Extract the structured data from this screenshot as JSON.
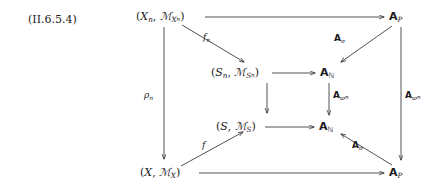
{
  "figure": {
    "tag": "(II.6.5.4)",
    "kind": "commutative-diagram"
  },
  "nodes": {
    "top_left": {
      "id": "X_n",
      "open": "(",
      "first": "X",
      "first_sub": "n",
      "comma": ", ",
      "sheaf": "ℳ",
      "sheaf_sub": "X",
      "sheaf_subsub": "n",
      "close": ")",
      "plain": "(X_n, ℳ_{X_n})"
    },
    "top_right": {
      "id": "A_P_top",
      "letter": "A",
      "sub": "P",
      "plain": "A_P"
    },
    "mid_upper_left": {
      "id": "S_n",
      "open": "(",
      "first": "S",
      "first_sub": "n",
      "comma": ", ",
      "sheaf": "ℳ",
      "sheaf_sub": "S",
      "sheaf_subsub": "n",
      "close": ")",
      "plain": "(S_n, ℳ_{S_n})"
    },
    "mid_upper_right": {
      "id": "A_N_upper",
      "letter": "A",
      "sub": "ℕ",
      "plain": "A_ℕ"
    },
    "mid_lower_left": {
      "id": "S",
      "open": "(",
      "first": "S",
      "first_sub": "",
      "comma": ", ",
      "sheaf": "ℳ",
      "sheaf_sub": "S",
      "sheaf_subsub": "",
      "close": ")",
      "plain": "(S, ℳ_S)"
    },
    "mid_lower_right": {
      "id": "A_N_lower",
      "letter": "A",
      "sub": "ℕ",
      "plain": "A_ℕ"
    },
    "bottom_left": {
      "id": "X",
      "open": "(",
      "first": "X",
      "first_sub": "",
      "comma": ", ",
      "sheaf": "ℳ",
      "sheaf_sub": "X",
      "sheaf_subsub": "",
      "close": ")",
      "plain": "(X, ℳ_X)"
    },
    "bottom_right": {
      "id": "A_P_bottom",
      "letter": "A",
      "sub": "P",
      "plain": "A_P"
    }
  },
  "arrow_labels": {
    "f_n": {
      "symbol": "f",
      "sub": "n",
      "plain": "f_n"
    },
    "f": {
      "symbol": "f",
      "sub": "",
      "plain": "f"
    },
    "rho_n": {
      "symbol": "ρ",
      "sub": "n",
      "plain": "ρ_n"
    },
    "A_sigma_top": {
      "letter": "A",
      "sub": "σ",
      "plain": "A_σ"
    },
    "A_sigma_bottom": {
      "letter": "A",
      "sub": "σ",
      "plain": "A_σ"
    },
    "A_varpi_n_mid": {
      "letter": "A",
      "sub": "ϖ",
      "subsub": "n",
      "plain": "A_{ϖ_n}"
    },
    "A_varpi_n_right": {
      "letter": "A",
      "sub": "ϖ",
      "subsub": "n",
      "plain": "A_{ϖ_n}"
    }
  },
  "edges": [
    {
      "name": "top-horizontal",
      "from": "top_left",
      "to": "top_right",
      "label": ""
    },
    {
      "name": "bottom-horizontal",
      "from": "bottom_left",
      "to": "bottom_right",
      "label": ""
    },
    {
      "name": "upper-inner-horizontal",
      "from": "mid_upper_left",
      "to": "mid_upper_right",
      "label": ""
    },
    {
      "name": "lower-inner-horizontal",
      "from": "mid_lower_left",
      "to": "mid_lower_right",
      "label": ""
    },
    {
      "name": "left-vertical",
      "from": "top_left",
      "to": "bottom_left",
      "label": "rho_n"
    },
    {
      "name": "right-vertical",
      "from": "top_right",
      "to": "bottom_right",
      "label": "A_varpi_n_right"
    },
    {
      "name": "inner-vertical",
      "from": "mid_upper_left",
      "to": "mid_lower_left",
      "label": ""
    },
    {
      "name": "inner-vertical-right",
      "from": "mid_upper_right",
      "to": "mid_lower_right",
      "label": "A_varpi_n_mid"
    },
    {
      "name": "diagonal-f-n",
      "from": "top_left",
      "to": "mid_upper_left",
      "label": "f_n"
    },
    {
      "name": "diagonal-f",
      "from": "bottom_left",
      "to": "mid_lower_left",
      "label": "f"
    },
    {
      "name": "diagonal-A-sigma-top",
      "from": "top_right",
      "to": "mid_upper_right",
      "label": "A_sigma_top"
    },
    {
      "name": "diagonal-A-sigma-bottom",
      "from": "bottom_right",
      "to": "mid_lower_right",
      "label": "A_sigma_bottom"
    }
  ],
  "style": {
    "ink": "#1a1a1a",
    "background": "#ffffff"
  }
}
